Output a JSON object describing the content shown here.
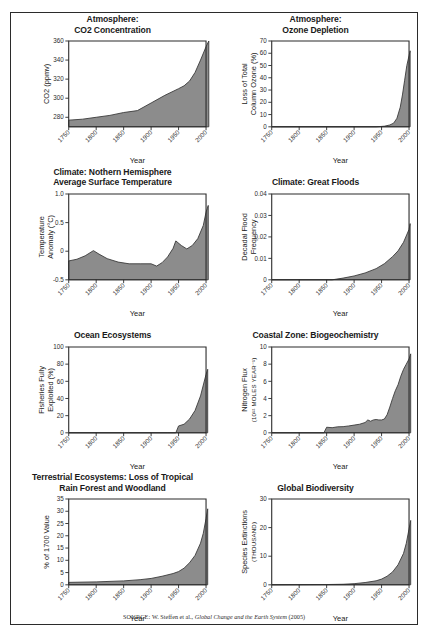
{
  "figure": {
    "source_prefix": "SOURCE:",
    "source_text": " W. Steffen et al., ",
    "source_italic": "Global Change and the Earth System",
    "source_year": " (2005)",
    "frame_color": "#2b2b2b",
    "fill_color": "#8c8c8c",
    "line_color": "#3a3a3a"
  },
  "chart_data": [
    {
      "id": "co2",
      "type": "area",
      "title": [
        "Atmosphere:",
        "CO2 Concentration"
      ],
      "xlabel": "Year",
      "ylabel": "CO2 (ppmv)",
      "xlim": [
        1750,
        2000
      ],
      "ylim": [
        270,
        360
      ],
      "xticks": [
        1750,
        1800,
        1850,
        1900,
        1950,
        2000
      ],
      "yticks": [
        280,
        300,
        320,
        340,
        360
      ],
      "ytick_labels": [
        "280",
        "300",
        "320",
        "340",
        "360"
      ],
      "x": [
        1750,
        1775,
        1800,
        1825,
        1850,
        1875,
        1900,
        1925,
        1950,
        1960,
        1970,
        1980,
        1990,
        2000,
        2005
      ],
      "values": [
        277,
        278,
        280,
        282,
        285,
        287,
        295,
        303,
        310,
        313,
        318,
        327,
        340,
        354,
        360
      ],
      "grid": false
    },
    {
      "id": "ozone",
      "type": "area",
      "title": [
        "Atmosphere:",
        "Ozone Depletion"
      ],
      "xlabel": "Year",
      "ylabel": "Loss of Total Column Ozone (%)",
      "ylabel_lines": [
        "Loss of Total",
        "Column Ozone (%)"
      ],
      "xlim": [
        1750,
        2000
      ],
      "ylim": [
        0,
        70
      ],
      "xticks": [
        1750,
        1800,
        1850,
        1900,
        1950,
        2000
      ],
      "yticks": [
        0,
        10,
        20,
        30,
        40,
        50,
        60,
        70
      ],
      "ytick_labels": [
        "0",
        "10",
        "20",
        "30",
        "40",
        "50",
        "60",
        "70"
      ],
      "x": [
        1750,
        1850,
        1900,
        1940,
        1955,
        1965,
        1972,
        1978,
        1984,
        1988,
        1992,
        1996,
        2000,
        2002
      ],
      "values": [
        0,
        0,
        0,
        0,
        0.5,
        1.5,
        3,
        7,
        16,
        26,
        38,
        50,
        58,
        62
      ],
      "grid": false
    },
    {
      "id": "temperature",
      "type": "area",
      "title": [
        "Climate: Nothern Hemisphere",
        "Average Surface Temperature"
      ],
      "xlabel": "Year",
      "ylabel": "Temperature Anomaly (°C)",
      "ylabel_lines": [
        "Temperature",
        "Anomaly (°C)"
      ],
      "xlim": [
        1750,
        2000
      ],
      "ylim": [
        -0.5,
        1.0
      ],
      "xticks": [
        1750,
        1800,
        1850,
        1900,
        1950,
        2000
      ],
      "yticks": [
        -0.5,
        0,
        0.5,
        1.0
      ],
      "ytick_labels": [
        "-0.5",
        "0",
        "0.5",
        "1.0"
      ],
      "x": [
        1750,
        1765,
        1780,
        1795,
        1805,
        1820,
        1840,
        1860,
        1880,
        1900,
        1910,
        1920,
        1930,
        1940,
        1945,
        1955,
        1965,
        1975,
        1985,
        1995,
        2000,
        2004
      ],
      "values": [
        -0.17,
        -0.14,
        -0.08,
        0.01,
        -0.05,
        -0.13,
        -0.19,
        -0.22,
        -0.22,
        -0.22,
        -0.26,
        -0.2,
        -0.1,
        0.05,
        0.18,
        0.1,
        0.04,
        0.1,
        0.22,
        0.45,
        0.68,
        0.8
      ],
      "grid": false
    },
    {
      "id": "floods",
      "type": "area",
      "title": [
        "Climate: Great Floods"
      ],
      "xlabel": "Year",
      "ylabel": "Decadal Flood Frequency",
      "ylabel_lines": [
        "Decadal Flood",
        "Frequency"
      ],
      "xlim": [
        1750,
        2000
      ],
      "ylim": [
        0,
        0.04
      ],
      "xticks": [
        1750,
        1800,
        1850,
        1900,
        1950,
        2000
      ],
      "yticks": [
        0,
        0.01,
        0.02,
        0.03,
        0.04
      ],
      "ytick_labels": [
        "0",
        "0.01",
        "0.02",
        "0.03",
        "0.04"
      ],
      "x": [
        1750,
        1860,
        1880,
        1900,
        1920,
        1940,
        1955,
        1970,
        1980,
        1990,
        2000,
        2002
      ],
      "values": [
        0,
        0,
        0.0008,
        0.0018,
        0.0032,
        0.0052,
        0.0075,
        0.0108,
        0.0135,
        0.0175,
        0.0235,
        0.0262
      ],
      "grid": false
    },
    {
      "id": "fisheries",
      "type": "area",
      "title": [
        "Ocean Ecosystems"
      ],
      "xlabel": "Year",
      "ylabel": "Fisheries Fully Exploited (%)",
      "ylabel_lines": [
        "Fisheries Fully",
        "Exploited (%)"
      ],
      "xlim": [
        1750,
        2000
      ],
      "ylim": [
        0,
        100
      ],
      "xticks": [
        1750,
        1800,
        1850,
        1900,
        1950,
        2000
      ],
      "yticks": [
        0,
        20,
        40,
        60,
        80,
        100
      ],
      "ytick_labels": [
        "0",
        "20",
        "40",
        "60",
        "80",
        "100"
      ],
      "x": [
        1750,
        1900,
        1930,
        1945,
        1950,
        1960,
        1970,
        1980,
        1990,
        1996,
        2000,
        2003
      ],
      "values": [
        0,
        0,
        0,
        0,
        8,
        10,
        16,
        26,
        43,
        58,
        68,
        74
      ],
      "grid": false
    },
    {
      "id": "nitrogen",
      "type": "area",
      "title": [
        "Coastal Zone: Biogeochemistry"
      ],
      "xlabel": "Year",
      "ylabel": "Nitrogen Flux (10^12 MOLES YEAR^-1)",
      "ylabel_lines": [
        "Nitrogen Flux",
        "(10¹² MOLES YEAR⁻¹)"
      ],
      "xlim": [
        1750,
        2000
      ],
      "ylim": [
        0,
        10
      ],
      "xticks": [
        1750,
        1800,
        1850,
        1900,
        1950,
        2000
      ],
      "yticks": [
        0,
        2,
        4,
        6,
        8,
        10
      ],
      "ytick_labels": [
        "0",
        "2",
        "4",
        "6",
        "8",
        "10"
      ],
      "x": [
        1750,
        1845,
        1850,
        1860,
        1870,
        1880,
        1890,
        1900,
        1910,
        1920,
        1925,
        1930,
        1935,
        1940,
        1945,
        1950,
        1955,
        1960,
        1965,
        1970,
        1975,
        1980,
        1985,
        1990,
        1995,
        2000,
        2003
      ],
      "values": [
        0,
        0,
        0.65,
        0.6,
        0.7,
        0.72,
        0.8,
        0.9,
        1.0,
        1.2,
        1.5,
        1.35,
        1.5,
        1.55,
        1.5,
        1.5,
        1.6,
        2.1,
        3.0,
        4.0,
        4.9,
        5.6,
        6.6,
        7.4,
        8.0,
        8.6,
        9.2
      ],
      "grid": false
    },
    {
      "id": "rainforest",
      "type": "area",
      "title": [
        "Terrestrial Ecosystems: Loss of Tropical",
        "Rain Forest and Woodland"
      ],
      "xlabel": "Year",
      "ylabel": "% of 1700 Value",
      "ylabel_lines": [
        "% of 1700 Value"
      ],
      "xlim": [
        1750,
        2000
      ],
      "ylim": [
        0,
        35
      ],
      "xticks": [
        1750,
        1800,
        1850,
        1900,
        1950,
        2000
      ],
      "yticks": [
        0,
        5,
        10,
        15,
        20,
        25,
        30,
        35
      ],
      "ytick_labels": [
        "0",
        "5",
        "10",
        "15",
        "20",
        "25",
        "30",
        "35"
      ],
      "x": [
        1750,
        1800,
        1850,
        1880,
        1900,
        1920,
        1940,
        1950,
        1960,
        1970,
        1980,
        1990,
        1995,
        2000,
        2003
      ],
      "values": [
        1.0,
        1.2,
        1.6,
        2.1,
        2.6,
        3.5,
        4.6,
        5.4,
        6.8,
        9.0,
        12.0,
        17.0,
        21.0,
        27.0,
        31.0
      ],
      "grid": false
    },
    {
      "id": "biodiversity",
      "type": "area",
      "title": [
        "Global Biodiversity"
      ],
      "xlabel": "Year",
      "ylabel": "Species Extinctions (THOUSAND)",
      "ylabel_lines": [
        "Species Extinctions",
        "(THOUSAND)"
      ],
      "xlim": [
        1750,
        2000
      ],
      "ylim": [
        0,
        30
      ],
      "xticks": [
        1750,
        1800,
        1850,
        1900,
        1950,
        2000
      ],
      "yticks": [
        0,
        10,
        20,
        30
      ],
      "ytick_labels": [
        "0",
        "10",
        "20",
        "30"
      ],
      "x": [
        1750,
        1850,
        1880,
        1900,
        1920,
        1940,
        1950,
        1960,
        1970,
        1980,
        1990,
        1995,
        2000,
        2003
      ],
      "values": [
        0,
        0.1,
        0.2,
        0.4,
        0.8,
        1.4,
        2.0,
        3.0,
        4.5,
        7.0,
        11.0,
        14.5,
        19.5,
        22.5
      ],
      "grid": false
    }
  ]
}
